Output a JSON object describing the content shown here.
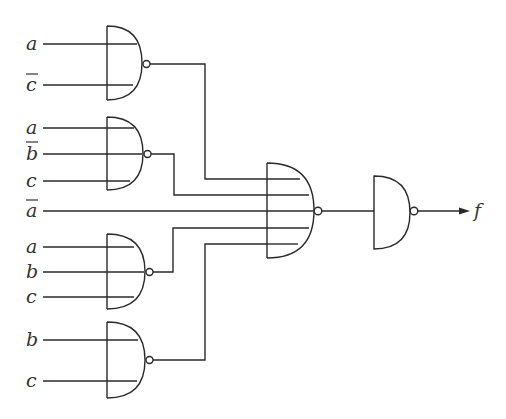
{
  "diagram": {
    "type": "logic-circuit",
    "gates": [
      {
        "id": "nand1",
        "type": "NAND",
        "inputs": [
          "a",
          "c'"
        ]
      },
      {
        "id": "nand2",
        "type": "NAND",
        "inputs": [
          "a",
          "b'",
          "c"
        ]
      },
      {
        "id": "nand3",
        "type": "NAND",
        "inputs": [
          "a",
          "b",
          "c"
        ]
      },
      {
        "id": "nand4",
        "type": "NAND",
        "inputs": [
          "b",
          "c"
        ]
      },
      {
        "id": "nand5",
        "type": "NAND",
        "inputs": [
          "nand1",
          "nand2",
          "a'",
          "nand3",
          "nand4"
        ]
      },
      {
        "id": "nand6",
        "type": "NAND",
        "inputs": [
          "nand5"
        ]
      }
    ],
    "labels": {
      "g1_in1": "a",
      "g1_in2": "c",
      "g2_in1": "a",
      "g2_in2": "b",
      "g2_in3": "c",
      "direct_in": "a",
      "g3_in1": "a",
      "g3_in2": "b",
      "g3_in3": "c",
      "g4_in1": "b",
      "g4_in2": "c",
      "output": "f"
    },
    "complemented_labels": [
      "g1_in2",
      "g2_in2",
      "direct_in"
    ],
    "colors": {
      "line": "#2a2a2a",
      "text": "#333333",
      "background": "#ffffff"
    }
  }
}
